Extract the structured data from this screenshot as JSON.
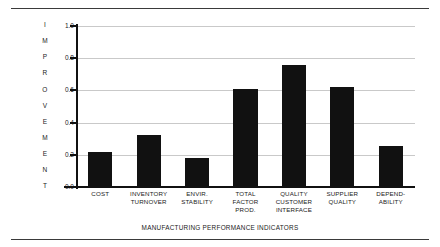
{
  "chart_data": {
    "type": "bar",
    "title": "",
    "xlabel": "MANUFACTURING PERFORMANCE INDICATORS",
    "ylabel": "IMPROVEMENT",
    "ylim": [
      0.0,
      1.0
    ],
    "grid": true,
    "legend": false,
    "categories": [
      "COST",
      "INVENTORY TURNOVER",
      "ENVIR. STABILITY",
      "TOTAL FACTOR PROD.",
      "QUALITY CUSTOMER INTERFACE",
      "SUPPLIER QUALITY",
      "DEPEND-ABILITY"
    ],
    "category_lines": [
      [
        "COST"
      ],
      [
        "INVENTORY",
        "TURNOVER"
      ],
      [
        "ENVIR.",
        "STABILITY"
      ],
      [
        "TOTAL",
        "FACTOR",
        "PROD."
      ],
      [
        "QUALITY",
        "CUSTOMER",
        "INTERFACE"
      ],
      [
        "SUPPLIER",
        "QUALITY"
      ],
      [
        "DEPEND-",
        "ABILITY"
      ]
    ],
    "values": [
      0.22,
      0.32,
      0.18,
      0.61,
      0.76,
      0.62,
      0.255
    ],
    "ytick_labels": [
      "1.0",
      "0.8",
      "0.6",
      "0.4",
      "0.2",
      "0.0"
    ],
    "ytick_values": [
      1.0,
      0.8,
      0.6,
      0.4,
      0.2,
      0.0
    ],
    "ylabel_letters": [
      "I",
      "M",
      "P",
      "R",
      "O",
      "V",
      "E",
      "M",
      "E",
      "N",
      "T"
    ],
    "bar_color": "#111111",
    "grid_color": "#c9c9c9",
    "axis_color": "#111111",
    "background": "#ffffff"
  }
}
